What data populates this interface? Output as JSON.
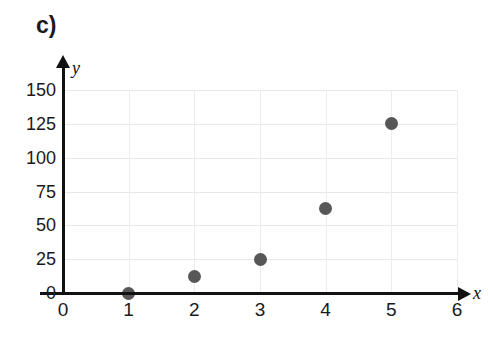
{
  "panel": {
    "label": "c)"
  },
  "chart_data": {
    "type": "scatter",
    "title": "c)",
    "xlabel": "x",
    "ylabel": "y",
    "x": [
      1,
      2,
      3,
      4,
      5
    ],
    "values": [
      0,
      12.5,
      25,
      62.5,
      125
    ],
    "points": [
      {
        "x": 1,
        "y": 0
      },
      {
        "x": 2,
        "y": 12.5
      },
      {
        "x": 3,
        "y": 25
      },
      {
        "x": 4,
        "y": 62.5
      },
      {
        "x": 5,
        "y": 125
      }
    ],
    "xlim": [
      0,
      6
    ],
    "ylim": [
      0,
      150
    ],
    "xticks": [
      "0",
      "1",
      "2",
      "3",
      "4",
      "5",
      "6"
    ],
    "yticks": [
      "0",
      "25",
      "50",
      "75",
      "100",
      "125",
      "150"
    ],
    "xtick_values": [
      0,
      1,
      2,
      3,
      4,
      5,
      6
    ],
    "ytick_values": [
      0,
      25,
      50,
      75,
      100,
      125,
      150
    ],
    "grid": true,
    "legend": null,
    "marker_color": "#575757",
    "grid_color": "#e8e8e8",
    "axis_color": "#111111"
  }
}
